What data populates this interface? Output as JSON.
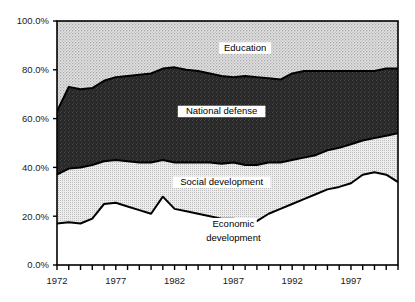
{
  "chart_data": {
    "type": "area",
    "stacked": true,
    "title": "",
    "subtitle": "",
    "xlabel": "",
    "ylabel": "",
    "xlim": [
      1972,
      2001
    ],
    "ylim": [
      0,
      100
    ],
    "grid": false,
    "legend_position": "inline-annotations",
    "y_tick_labels": [
      "0.0%",
      "20.0%",
      "40.0%",
      "60.0%",
      "80.0%",
      "100.0%"
    ],
    "y_tick_values": [
      0,
      20,
      40,
      60,
      80,
      100
    ],
    "x_tick_labels": [
      "1972",
      "1977",
      "1982",
      "1987",
      "1992",
      "1997"
    ],
    "x_tick_values": [
      1972,
      1977,
      1982,
      1987,
      1992,
      1997
    ],
    "x_minor_tick_step": 1,
    "x": [
      1972,
      1973,
      1974,
      1975,
      1976,
      1977,
      1978,
      1979,
      1980,
      1981,
      1982,
      1983,
      1984,
      1985,
      1986,
      1987,
      1988,
      1989,
      1990,
      1991,
      1992,
      1993,
      1994,
      1995,
      1996,
      1997,
      1998,
      1999,
      2000,
      2001
    ],
    "series": [
      {
        "name": "Economic development",
        "fill": "#ffffff",
        "pattern": "solid-white",
        "values": [
          17.0,
          17.5,
          17.0,
          19.0,
          25.0,
          25.5,
          24.0,
          22.5,
          21.0,
          28.0,
          23.0,
          22.0,
          21.0,
          20.0,
          19.0,
          19.0,
          18.0,
          18.0,
          21.0,
          23.0,
          25.0,
          27.0,
          29.0,
          31.0,
          32.0,
          33.5,
          37.0,
          38.0,
          37.0,
          34.0
        ]
      },
      {
        "name": "Social development",
        "fill": "#dcdcdc",
        "pattern": "fine-dots",
        "values": [
          20.0,
          22.0,
          23.0,
          22.0,
          17.5,
          17.5,
          18.5,
          19.5,
          21.0,
          15.0,
          19.0,
          20.0,
          21.0,
          22.0,
          22.5,
          23.0,
          23.0,
          23.0,
          21.0,
          19.0,
          18.0,
          17.0,
          16.0,
          16.0,
          16.0,
          16.0,
          14.0,
          14.0,
          16.0,
          20.0
        ]
      },
      {
        "name": "National defense",
        "fill": "#2a2a2a",
        "pattern": "dark-noise",
        "values": [
          26.0,
          33.5,
          32.0,
          31.5,
          33.0,
          34.0,
          35.0,
          36.0,
          36.5,
          37.5,
          39.0,
          38.0,
          37.5,
          36.5,
          36.0,
          35.0,
          36.5,
          36.0,
          34.5,
          34.0,
          35.5,
          35.5,
          34.5,
          32.5,
          31.5,
          30.0,
          28.5,
          27.5,
          27.5,
          26.5
        ]
      },
      {
        "name": "Education",
        "fill": "#cfcfcf",
        "pattern": "coarse-stipple",
        "values": [
          37.0,
          27.0,
          28.0,
          27.5,
          24.5,
          23.0,
          22.5,
          22.0,
          21.5,
          19.5,
          19.0,
          20.0,
          20.5,
          21.5,
          22.5,
          23.0,
          22.5,
          23.0,
          23.5,
          24.0,
          21.5,
          20.5,
          20.5,
          20.5,
          20.5,
          20.5,
          20.5,
          20.5,
          19.5,
          19.5
        ]
      }
    ],
    "annotations": [
      {
        "text": "Education",
        "x": 1988,
        "y": 88,
        "series": "Education"
      },
      {
        "text": "National defense",
        "x": 1986,
        "y": 62,
        "series": "National defense"
      },
      {
        "text": "Social development",
        "x": 1986,
        "y": 33,
        "series": "Social development"
      },
      {
        "text": "Economic",
        "x": 1987,
        "y": 16,
        "series": "Economic development"
      },
      {
        "text": "development",
        "x": 1987,
        "y": 10,
        "series": "Economic development"
      }
    ]
  },
  "colors": {
    "axis": "#000000",
    "frame": "#000000",
    "text": "#1a1a1a",
    "education": "#cfcfcf",
    "national_defense": "#2a2a2a",
    "social_development": "#dcdcdc",
    "economic_development": "#ffffff"
  }
}
